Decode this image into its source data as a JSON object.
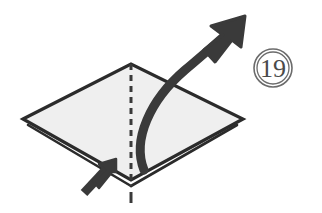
{
  "page": {
    "background_color": "#ffffff",
    "width": 322,
    "height": 213
  },
  "step_badge": {
    "label": "19",
    "shape": "double-circle",
    "center_x": 273,
    "center_y": 68,
    "outer_radius": 19,
    "inner_radius": 16,
    "stroke_color": "#6b6b6b",
    "text_color": "#4a4a4a",
    "font_size": 26
  },
  "paper": {
    "name": "folded-paper-diamond",
    "fill_color": "#efefef",
    "stroke_color": "#2b2b2b",
    "stroke_width": 3.2,
    "vertices": {
      "left": {
        "x": 23,
        "y": 119
      },
      "top": {
        "x": 131,
        "y": 64
      },
      "right": {
        "x": 243,
        "y": 119
      },
      "bottom": {
        "x": 131,
        "y": 180
      }
    },
    "outline_path": "M23,119 L131,64 L243,119 L131,180 Z",
    "layer_edges": [
      {
        "name": "bottom-left-layer-edge",
        "path": "M28,125 L131,186",
        "stroke_width": 2.6
      },
      {
        "name": "bottom-right-layer-edge",
        "path": "M237,125 L131,186",
        "stroke_width": 2.6
      }
    ]
  },
  "crease_line": {
    "name": "vertical-center-crease",
    "style": "dashed",
    "color": "#3a3a3a",
    "stroke_width": 3,
    "dash_pattern": "6 5",
    "path": "M131,64 L131,186",
    "extension": {
      "name": "crease-extension-dash",
      "path": "M131,192 L131,203",
      "stroke_width": 3
    }
  },
  "fold_arrow": {
    "name": "large-curved-fold-arrow",
    "color": "#3a3a3a",
    "description": "thick curved arrow sweeping from lower center up to the upper right",
    "curve_path": "M144,170 C132,140 150,100 185,70 C203,55 222,38 237,25",
    "stroke_width": 9,
    "head": {
      "tip": {
        "x": 245,
        "y": 16
      },
      "polygon": "245,16 211,26 223,35 204,50 215,62 232,40 241,47"
    }
  },
  "push_arrow": {
    "name": "small-push-arrow",
    "color": "#3a3a3a",
    "description": "short thick straight arrow at lower left pointing up toward the bottom vertex",
    "shaft_path": "M84,193 L111,164",
    "stroke_width": 9,
    "head": {
      "tip": {
        "x": 116,
        "y": 159
      },
      "polygon": "116,159 99,164 105,170 93,181 99,188 112,172 116,172"
    }
  },
  "accessibility": {
    "figure_caption": "Step 19: fold the near flap upward along the vertical center crease"
  }
}
